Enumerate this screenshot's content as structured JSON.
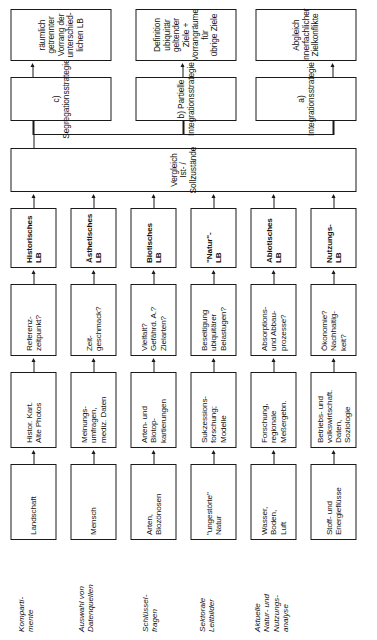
{
  "diagram": {
    "row_labels": [
      {
        "id": "kompartimente",
        "text": "Komparti-\nmente"
      },
      {
        "id": "auswahl-datenquellen",
        "text": "Auswahl von\nDatenquellen"
      },
      {
        "id": "schluesselfragen",
        "text": "Schlüssel-\nfragen"
      },
      {
        "id": "sektorale-leitbilder",
        "text": "Sektorale\nLeitbilder"
      },
      {
        "id": "aktuelle-analyse",
        "text": "Aktuelle\nNatur- und\nNutzungs-\nanalyse"
      }
    ],
    "columns": {
      "kompartimente": [
        "Landschaft",
        "Mensch",
        "Arten,\nBiozönosen",
        "\"ungestörte\"\nNatur",
        "Wasser,\nBoden,\nLuft",
        "Stoff- und\nEnergieflüsse"
      ],
      "datenquellen": [
        "Histor. Kart.\nAlte Photos",
        "Meinungs-\numfragen,\nmediz. Daten",
        "Arten- und\nBiotop-\nkartierungen",
        "Sukzessions-\nforschung;\nModelle",
        "Forschung,\nregionale\nMeßergebn.",
        "Betriebs- und\nvolkswirtschaft.\nDaten,\nSoziologie"
      ],
      "schluesselfragen": [
        "Referenz-\nzeitpunkt?",
        "Zeit-\ngeschmack?",
        "Vielfalt?\nGefährd. A.?\nZielarten?",
        "Beseitigung\nubiquitärer\nBelastugen?",
        "Absorptions-\nund Abbau-\nprozesse?",
        "Ökonomie?\nNachhaltig-\nkeit?"
      ],
      "leitbilder": [
        "Historisches\nLB",
        "Ästhetisches\nLB",
        "Biotisches\nLB",
        "\"Natur\"-\nLB",
        "Abiotisches\nLB",
        "Nutzungs-\nLB"
      ]
    },
    "comparison_box": {
      "label": "Vergleich Ist- / Sollzustände"
    },
    "strategies": [
      {
        "id": "integrationsstrategie",
        "label": "a) Integrationsstrategie",
        "outcome": "Abgleich innerfachlicher\nZielkonflikte"
      },
      {
        "id": "partielle-integrationsstrategie",
        "label": "b) Partielle\nIntegrationsstrategie",
        "outcome": "Definition ubiquitär geltender\nZiele + Vorrangräume für\nübrige Ziele"
      },
      {
        "id": "segregationsstrategie",
        "label": "c) Segregationsstrategie",
        "outcome": "räumlich getrennter\nVorrang der unterschied-\nlichen LB"
      }
    ],
    "colors": {
      "line": "#1a1a1a",
      "box_fill": "#ffffff",
      "text": "#111111"
    }
  }
}
